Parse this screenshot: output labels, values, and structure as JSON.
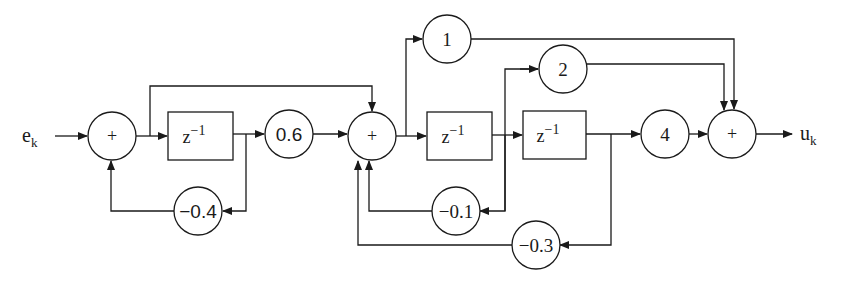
{
  "diagram": {
    "type": "block-diagram",
    "input": {
      "label": "e",
      "subscript": "k"
    },
    "output": {
      "label": "u",
      "subscript": "k"
    },
    "summers": [
      {
        "id": "sum1",
        "label": "+"
      },
      {
        "id": "sum2",
        "label": "+"
      },
      {
        "id": "sum3",
        "label": "+"
      }
    ],
    "delays": [
      {
        "id": "delay1",
        "base": "z",
        "exp": "−1"
      },
      {
        "id": "delay2",
        "base": "z",
        "exp": "−1"
      },
      {
        "id": "delay3",
        "base": "z",
        "exp": "−1"
      }
    ],
    "gains": [
      {
        "id": "g06",
        "label": "0.6"
      },
      {
        "id": "gm04",
        "label": "−0.4"
      },
      {
        "id": "g1",
        "label": "1"
      },
      {
        "id": "g2",
        "label": "2"
      },
      {
        "id": "g4",
        "label": "4"
      },
      {
        "id": "gm01",
        "label": "−0.1"
      },
      {
        "id": "gm03",
        "label": "−0.3"
      }
    ],
    "color": "#1a1a1a"
  }
}
